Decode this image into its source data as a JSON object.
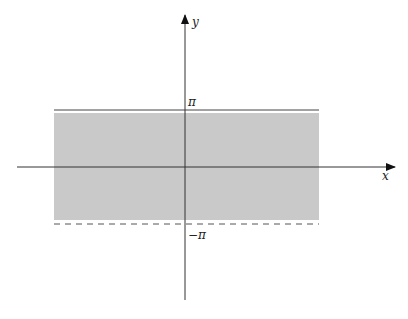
{
  "diagram": {
    "type": "region-plot",
    "axes": {
      "x_label": "x",
      "y_label": "y",
      "origin": [
        185,
        167
      ]
    },
    "upper_bound": {
      "label": "π",
      "style": "solid",
      "y": 110
    },
    "lower_bound": {
      "label": "−π",
      "style": "dashed",
      "y": 224
    },
    "shaded_region": {
      "x0": 54,
      "x1": 319,
      "y0": 113,
      "y1": 220,
      "color": "#c8c8c8"
    },
    "colors": {
      "axis": "#333333",
      "shade": "#c8c8c8",
      "line": "#444444"
    }
  }
}
